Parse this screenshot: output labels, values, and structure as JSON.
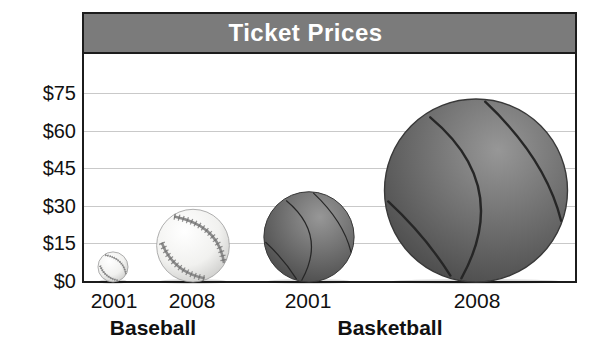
{
  "chart": {
    "title": "Ticket Prices",
    "colors": {
      "title_bar": "#7b7b7b",
      "title_text": "#ffffff",
      "frame_border": "#1c1c1c",
      "gridline": "#c9c9c9",
      "basketball": "#6e6e6e",
      "baseball": "#f4f4f2"
    },
    "y_axis": {
      "tick_values": [
        0,
        15,
        30,
        45,
        60,
        75
      ],
      "tick_labels": [
        "$0",
        "$15",
        "$30",
        "$45",
        "$60",
        "$75"
      ]
    },
    "x_axis": {
      "year_labels": [
        "2001",
        "2008",
        "2001",
        "2008"
      ],
      "group_labels": [
        "Baseball",
        "Basketball"
      ]
    }
  },
  "chart_data": {
    "type": "bar",
    "subtype": "pictograph (ball size encodes price)",
    "title": "Ticket Prices",
    "categories": [
      "Baseball 2001",
      "Baseball 2008",
      "Basketball 2001",
      "Basketball 2008"
    ],
    "series": [
      {
        "name": "Baseball",
        "icon": "baseball",
        "x": [
          "2001",
          "2008"
        ],
        "values": [
          12,
          29
        ]
      },
      {
        "name": "Basketball",
        "icon": "basketball",
        "x": [
          "2001",
          "2008"
        ],
        "values": [
          36,
          73
        ]
      }
    ],
    "xlabel": "",
    "ylabel": "",
    "ylim": [
      0,
      90
    ],
    "yticks": [
      0,
      15,
      30,
      45,
      60,
      75
    ],
    "ytick_labels": [
      "$0",
      "$15",
      "$30",
      "$45",
      "$60",
      "$75"
    ],
    "grid": true,
    "legend": false
  }
}
